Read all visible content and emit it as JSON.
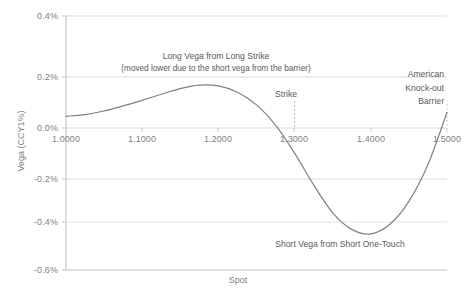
{
  "chart_data": {
    "type": "line",
    "title": "",
    "xlabel": "Spot",
    "ylabel": "Vega (CCY1%)",
    "xlim": [
      1.0,
      1.5
    ],
    "ylim": [
      -0.6,
      0.4
    ],
    "grid": true,
    "legend": "none",
    "x_ticks": [
      "1.0000",
      "1.1000",
      "1.2000",
      "1.3000",
      "1.4000",
      "1.5000"
    ],
    "x_tick_values": [
      1.0,
      1.1,
      1.2,
      1.3,
      1.4,
      1.5
    ],
    "y_ticks": [
      "0.4%",
      "0.2%",
      "0.0%",
      "-0.2%",
      "-0.4%",
      "-0.6%"
    ],
    "y_tick_values": [
      0.4,
      0.2,
      0.0,
      -0.2,
      -0.4,
      -0.6
    ],
    "series": [
      {
        "name": "Vega",
        "color": "#808080",
        "x": [
          1.0,
          1.025,
          1.05,
          1.075,
          1.1,
          1.125,
          1.15,
          1.175,
          1.2,
          1.225,
          1.25,
          1.275,
          1.3,
          1.325,
          1.35,
          1.375,
          1.4,
          1.425,
          1.45,
          1.475,
          1.5
        ],
        "y": [
          0.005,
          0.012,
          0.026,
          0.046,
          0.068,
          0.092,
          0.114,
          0.128,
          0.125,
          0.1,
          0.05,
          -0.03,
          -0.14,
          -0.265,
          -0.375,
          -0.44,
          -0.458,
          -0.42,
          -0.33,
          -0.185,
          0.02
        ]
      }
    ],
    "vertical_markers": [
      {
        "name": "strike",
        "value": 1.3,
        "style": "dotted",
        "color": "#a6a6a6"
      },
      {
        "name": "barrier",
        "value": 1.5,
        "style": "dotted",
        "color": "#bfbfbf"
      }
    ],
    "annotations": [
      {
        "name": "long-vega",
        "line1": "Long Vega from Long Strike",
        "line2": "(moved lower due to the short vega from the barrier)"
      },
      {
        "name": "strike",
        "text": "Strike"
      },
      {
        "name": "barrier",
        "line1": "American",
        "line2": "Knock-out",
        "line3": "Barrier"
      },
      {
        "name": "short-vega",
        "text": "Short Vega from Short One-Touch"
      }
    ],
    "colors": {
      "line": "#808080",
      "grid": "#d9d9d9",
      "axis": "#bfbfbf",
      "text": "#7f7f7f",
      "annotation_text": "#595959",
      "background": "#ffffff"
    }
  }
}
